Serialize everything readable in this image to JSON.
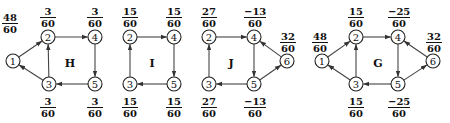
{
  "diagrams": [
    {
      "id": "H",
      "label": "H",
      "label_pos": [
        70,
        63
      ],
      "nodes": [
        {
          "id": "1",
          "x": 13,
          "y": 61
        },
        {
          "id": "2",
          "x": 48,
          "y": 37
        },
        {
          "id": "4",
          "x": 95,
          "y": 37
        },
        {
          "id": "3",
          "x": 49,
          "y": 84
        },
        {
          "id": "5",
          "x": 95,
          "y": 84
        }
      ],
      "edges": [
        [
          "1",
          "2"
        ],
        [
          "2",
          "4"
        ],
        [
          "4",
          "5"
        ],
        [
          "5",
          "3"
        ],
        [
          "3",
          "2"
        ],
        [
          "3",
          "1"
        ]
      ],
      "fractions": [
        {
          "node": "1",
          "num": "48",
          "den": "60",
          "x": 10,
          "y": 12
        },
        {
          "node": "2",
          "num": "3",
          "den": "60",
          "x": 48,
          "y": 6
        },
        {
          "node": "4",
          "num": "3",
          "den": "60",
          "x": 95,
          "y": 6
        },
        {
          "node": "3",
          "num": "3",
          "den": "60",
          "x": 48,
          "y": 96
        },
        {
          "node": "5",
          "num": "3",
          "den": "60",
          "x": 95,
          "y": 96
        }
      ]
    },
    {
      "id": "I",
      "label": "I",
      "label_pos": [
        152,
        63
      ],
      "nodes": [
        {
          "id": "2",
          "x": 130,
          "y": 37
        },
        {
          "id": "4",
          "x": 174,
          "y": 37
        },
        {
          "id": "3",
          "x": 130,
          "y": 84
        },
        {
          "id": "5",
          "x": 174,
          "y": 84
        }
      ],
      "edges": [
        [
          "2",
          "4"
        ],
        [
          "4",
          "5"
        ],
        [
          "5",
          "3"
        ],
        [
          "3",
          "2"
        ]
      ],
      "fractions": [
        {
          "node": "2",
          "num": "15",
          "den": "60",
          "x": 130,
          "y": 6
        },
        {
          "node": "4",
          "num": "15",
          "den": "60",
          "x": 174,
          "y": 6
        },
        {
          "node": "3",
          "num": "15",
          "den": "60",
          "x": 130,
          "y": 96
        },
        {
          "node": "5",
          "num": "15",
          "den": "60",
          "x": 174,
          "y": 96
        }
      ]
    },
    {
      "id": "J",
      "label": "J",
      "label_pos": [
        231,
        63
      ],
      "nodes": [
        {
          "id": "2",
          "x": 209,
          "y": 37
        },
        {
          "id": "4",
          "x": 254,
          "y": 37
        },
        {
          "id": "3",
          "x": 209,
          "y": 84
        },
        {
          "id": "5",
          "x": 254,
          "y": 84
        },
        {
          "id": "6",
          "x": 287,
          "y": 61
        }
      ],
      "edges": [
        [
          "2",
          "4"
        ],
        [
          "4",
          "5"
        ],
        [
          "5",
          "3"
        ],
        [
          "3",
          "2"
        ],
        [
          "5",
          "6"
        ],
        [
          "6",
          "4"
        ]
      ],
      "fractions": [
        {
          "node": "2",
          "num": "27",
          "den": "60",
          "x": 209,
          "y": 6
        },
        {
          "node": "4",
          "num": "−13",
          "den": "60",
          "x": 255,
          "y": 6
        },
        {
          "node": "6",
          "num": "32",
          "den": "60",
          "x": 288,
          "y": 31
        },
        {
          "node": "3",
          "num": "27",
          "den": "60",
          "x": 209,
          "y": 96
        },
        {
          "node": "5",
          "num": "−13",
          "den": "60",
          "x": 255,
          "y": 96
        }
      ]
    },
    {
      "id": "G",
      "label": "G",
      "label_pos": [
        378,
        63
      ],
      "nodes": [
        {
          "id": "1",
          "x": 322,
          "y": 61
        },
        {
          "id": "2",
          "x": 356,
          "y": 37
        },
        {
          "id": "4",
          "x": 398,
          "y": 37
        },
        {
          "id": "3",
          "x": 356,
          "y": 84
        },
        {
          "id": "5",
          "x": 398,
          "y": 84
        },
        {
          "id": "6",
          "x": 433,
          "y": 61
        }
      ],
      "edges": [
        [
          "1",
          "2"
        ],
        [
          "2",
          "4"
        ],
        [
          "4",
          "5"
        ],
        [
          "5",
          "3"
        ],
        [
          "3",
          "2"
        ],
        [
          "3",
          "1"
        ],
        [
          "5",
          "6"
        ],
        [
          "6",
          "4"
        ]
      ],
      "fractions": [
        {
          "node": "1",
          "num": "48",
          "den": "60",
          "x": 320,
          "y": 31
        },
        {
          "node": "2",
          "num": "15",
          "den": "60",
          "x": 356,
          "y": 6
        },
        {
          "node": "4",
          "num": "−25",
          "den": "60",
          "x": 399,
          "y": 6
        },
        {
          "node": "6",
          "num": "32",
          "den": "60",
          "x": 434,
          "y": 31
        },
        {
          "node": "3",
          "num": "15",
          "den": "60",
          "x": 356,
          "y": 96
        },
        {
          "node": "5",
          "num": "−25",
          "den": "60",
          "x": 399,
          "y": 96
        }
      ]
    }
  ],
  "style": {
    "node_radius": 7,
    "edge_color": "#444444",
    "text_color": "#111111"
  }
}
